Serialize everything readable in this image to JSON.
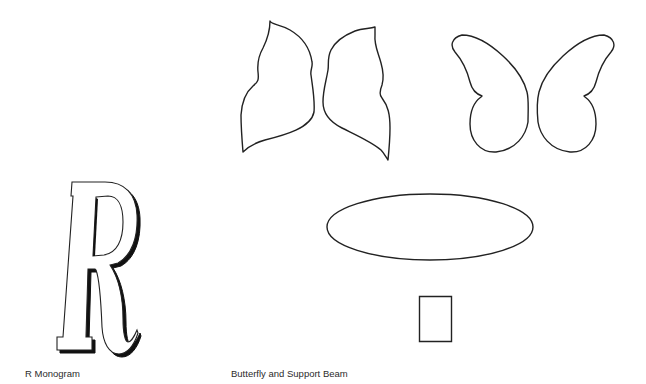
{
  "captions": {
    "left": "R Monogram",
    "right": "Butterfly and Support Beam"
  },
  "shapes": {
    "monogram_letter": "R",
    "stroke_color": "#222222",
    "fill_color": "#ffffff",
    "shadow_color": "#111111"
  }
}
